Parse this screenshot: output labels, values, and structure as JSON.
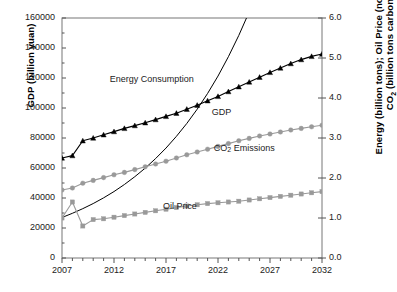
{
  "chart_data": {
    "type": "line",
    "title": "",
    "xlabel": "",
    "ylabel": "GDP (billion yuan)",
    "ylabel_right_line1": "Energy (billion tons); Oil Price (normalized);",
    "ylabel_right_line2": "CO2 (billion tons carbon)",
    "grid": false,
    "legend_position": "inline-annotations",
    "x": [
      2007,
      2008,
      2009,
      2010,
      2011,
      2012,
      2013,
      2014,
      2015,
      2016,
      2017,
      2018,
      2019,
      2020,
      2021,
      2022,
      2023,
      2024,
      2025,
      2026,
      2027,
      2028,
      2029,
      2030,
      2031,
      2032
    ],
    "xlim": [
      2007,
      2032
    ],
    "xtick_labels": [
      "2007",
      "2012",
      "2017",
      "2022",
      "2027",
      "2032"
    ],
    "xtick_values": [
      2007,
      2012,
      2017,
      2022,
      2027,
      2032
    ],
    "ylim_left": [
      0,
      160000
    ],
    "ytick_labels_left": [
      "0",
      "20000",
      "40000",
      "60000",
      "80000",
      "100000",
      "120000",
      "140000",
      "160000"
    ],
    "ytick_values_left": [
      0,
      20000,
      40000,
      60000,
      80000,
      100000,
      120000,
      140000,
      160000
    ],
    "ylim_right": [
      0,
      6.0
    ],
    "ytick_labels_right": [
      "0.0",
      "1.0",
      "2.0",
      "3.0",
      "4.0",
      "5.0",
      "6.0"
    ],
    "ytick_values_right": [
      0.0,
      1.0,
      2.0,
      3.0,
      4.0,
      5.0,
      6.0
    ],
    "series": [
      {
        "name": "GDP",
        "axis": "left",
        "unit": "billion yuan",
        "color": "#000000",
        "marker": "none",
        "label_text": "GDP",
        "values": [
          27000,
          29800,
          32900,
          36300,
          40100,
          44300,
          49000,
          54200,
          59900,
          66300,
          73300,
          81100,
          89700,
          99200,
          109700,
          121300,
          134200,
          148400,
          164100,
          181500,
          200700,
          221900,
          245400,
          271300,
          300000,
          331500
        ]
      },
      {
        "name": "Energy Consumption",
        "axis": "right",
        "unit": "billion tons",
        "color": "#000000",
        "marker": "triangle",
        "label_text": "Energy Consumption",
        "values": [
          2.5,
          2.56,
          2.93,
          3.0,
          3.08,
          3.16,
          3.24,
          3.31,
          3.38,
          3.46,
          3.54,
          3.62,
          3.72,
          3.82,
          3.93,
          4.04,
          4.16,
          4.28,
          4.4,
          4.52,
          4.64,
          4.75,
          4.86,
          4.96,
          5.04,
          5.1
        ]
      },
      {
        "name": "CO2 Emissions",
        "axis": "right",
        "unit": "billion tons carbon",
        "color": "#999999",
        "marker": "circle",
        "label_text": "CO2 Emissions",
        "values": [
          1.7,
          1.75,
          1.87,
          1.94,
          2.01,
          2.08,
          2.14,
          2.21,
          2.28,
          2.35,
          2.42,
          2.5,
          2.58,
          2.65,
          2.72,
          2.79,
          2.86,
          2.93,
          2.99,
          3.05,
          3.1,
          3.15,
          3.2,
          3.24,
          3.28,
          3.32
        ]
      },
      {
        "name": "Oil Price",
        "axis": "right",
        "unit": "normalized",
        "color": "#999999",
        "marker": "square",
        "label_text": "Oil Price",
        "values": [
          1.0,
          1.4,
          0.8,
          0.96,
          0.98,
          1.02,
          1.06,
          1.1,
          1.14,
          1.18,
          1.22,
          1.26,
          1.3,
          1.33,
          1.36,
          1.38,
          1.4,
          1.42,
          1.45,
          1.48,
          1.51,
          1.54,
          1.57,
          1.6,
          1.63,
          1.66
        ]
      }
    ],
    "annotations": [
      {
        "text": "Energy Consumption",
        "x": 2011.6,
        "y": 4.45
      },
      {
        "text": "GDP",
        "x": 2021.4,
        "y": 3.62
      },
      {
        "text": "CO2 Emissions",
        "x": 2021.6,
        "y": 2.72
      },
      {
        "text": "Oil Price",
        "x": 2016.7,
        "y": 1.28
      }
    ]
  },
  "colors": {
    "axis": "#555555",
    "frame": "#777777",
    "series_dark": "#000000",
    "series_gray": "#999999",
    "text": "#222222"
  }
}
